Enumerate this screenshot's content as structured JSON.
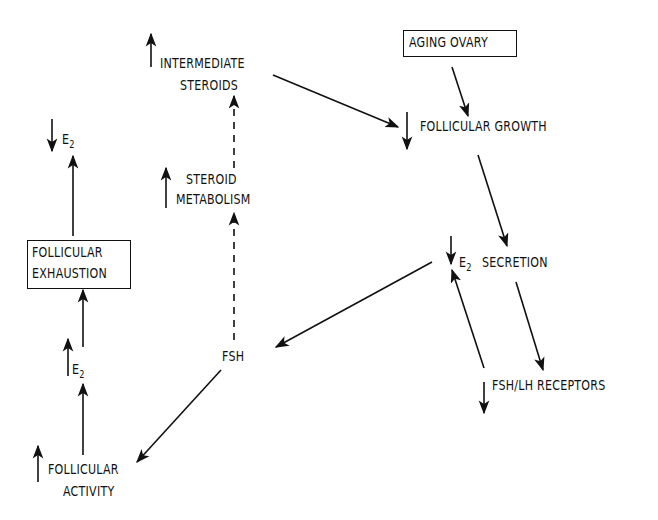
{
  "diagram": {
    "title": "",
    "nodes": {
      "aging_ovary": {
        "label": "AGING OVARY",
        "boxed": true
      },
      "follicular_growth": {
        "label": "FOLLICULAR GROWTH",
        "direction": "down"
      },
      "intermediate_steroids": {
        "line1": "INTERMEDIATE",
        "line2": "STEROIDS",
        "direction": "up"
      },
      "steroid_metabolism": {
        "line1": "STEROID",
        "line2": "METABOLISM",
        "direction": "up"
      },
      "e2_secretion": {
        "e": "E",
        "sub": "2",
        "label": "SECRETION",
        "direction": "down"
      },
      "fsh": {
        "label": "FSH"
      },
      "fsh_lh_receptors": {
        "label": "FSH/LH RECEPTORS",
        "direction": "down"
      },
      "e2_top_left": {
        "e": "E",
        "sub": "2",
        "direction": "down"
      },
      "follicular_exhaustion": {
        "line1": "FOLLICULAR",
        "line2": "EXHAUSTION",
        "boxed": true
      },
      "e2_mid_left": {
        "e": "E",
        "sub": "2",
        "direction": "up"
      },
      "follicular_activity": {
        "line1": "FOLLICULAR",
        "line2": "ACTIVITY",
        "direction": "up"
      }
    },
    "edges": [
      {
        "from": "aging_ovary",
        "to": "follicular_growth",
        "style": "solid"
      },
      {
        "from": "intermediate_steroids",
        "to": "follicular_growth",
        "style": "solid"
      },
      {
        "from": "follicular_growth",
        "to": "e2_secretion",
        "style": "solid"
      },
      {
        "from": "e2_secretion",
        "to": "fsh",
        "style": "solid"
      },
      {
        "from": "e2_secretion",
        "to": "fsh_lh_receptors",
        "style": "solid"
      },
      {
        "from": "fsh_lh_receptors",
        "to": "e2_secretion",
        "style": "solid"
      },
      {
        "from": "fsh",
        "to": "steroid_metabolism",
        "style": "dashed"
      },
      {
        "from": "steroid_metabolism",
        "to": "intermediate_steroids",
        "style": "dashed"
      },
      {
        "from": "fsh",
        "to": "follicular_activity",
        "style": "solid"
      },
      {
        "from": "follicular_activity",
        "to": "e2_mid_left",
        "style": "solid"
      },
      {
        "from": "e2_mid_left",
        "to": "follicular_exhaustion",
        "style": "solid"
      },
      {
        "from": "follicular_exhaustion",
        "to": "e2_top_left",
        "style": "solid"
      }
    ]
  }
}
